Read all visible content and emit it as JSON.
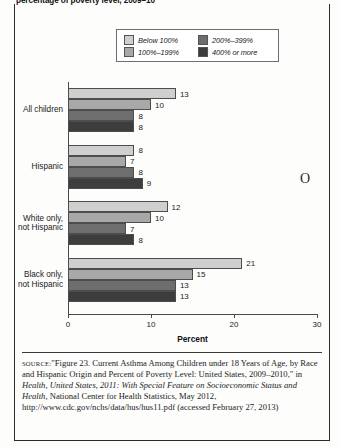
{
  "title": "percentage of poverty level, 2009–10",
  "legend": {
    "items": [
      {
        "label": "Below 100%",
        "color": "#cfcfcf"
      },
      {
        "label": "200%–399%",
        "color": "#6e6e6e"
      },
      {
        "label": "100%–199%",
        "color": "#a8a8a8"
      },
      {
        "label": "400% or more",
        "color": "#3d3d3d"
      }
    ]
  },
  "artifact": "O",
  "xaxis_title": "Percent",
  "source": {
    "kicker": "source:",
    "text_1": "\"Figure 23. Current Asthma Among Children under 18 Years of Age, by Race and Hispanic Origin and Percent of Poverty Level: United States, 2009–2010,\" in ",
    "italic_1": "Health, United States, 2011: With Special Feature on Socioeconomic Status and Health,",
    "text_2": " National Center for Health Statistics, May 2012, http://www.cdc.gov/nchs/data/hus/hus11.pdf (accessed February 27, 2013)"
  },
  "chart_data": {
    "type": "bar",
    "orientation": "horizontal",
    "title": "percentage of poverty level, 2009–10",
    "xlabel": "Percent",
    "ylabel": "",
    "xlim": [
      0,
      30
    ],
    "xticks": [
      0,
      10,
      20,
      30
    ],
    "grid": false,
    "legend_position": "top-center",
    "categories": [
      "All children",
      "Hispanic",
      "White only, not Hispanic",
      "Black only, not Hispanic"
    ],
    "series": [
      {
        "name": "Below 100%",
        "color": "#cfcfcf",
        "values": [
          13,
          8,
          12,
          21
        ]
      },
      {
        "name": "100%–199%",
        "color": "#a8a8a8",
        "values": [
          10,
          7,
          10,
          15
        ]
      },
      {
        "name": "200%–399%",
        "color": "#6e6e6e",
        "values": [
          8,
          8,
          7,
          13
        ]
      },
      {
        "name": "400% or more",
        "color": "#3d3d3d",
        "values": [
          8,
          9,
          8,
          13
        ]
      }
    ]
  }
}
